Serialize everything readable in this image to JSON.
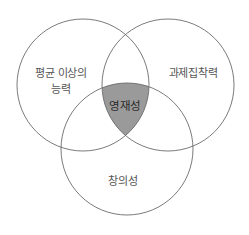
{
  "diagram": {
    "type": "venn-3",
    "colors": {
      "background": "#ffffff",
      "stroke": "#6b6b6b",
      "intersection_fill": "#9a9a9a",
      "label_text": "#555555",
      "center_text": "#2a2a2a"
    },
    "sets": [
      {
        "id": "left",
        "label_line1": "평균 이상의",
        "label_line2": "능력"
      },
      {
        "id": "right",
        "label": "과제집착력"
      },
      {
        "id": "bottom",
        "label": "창의성"
      }
    ],
    "intersection": {
      "label": "영재성"
    }
  }
}
